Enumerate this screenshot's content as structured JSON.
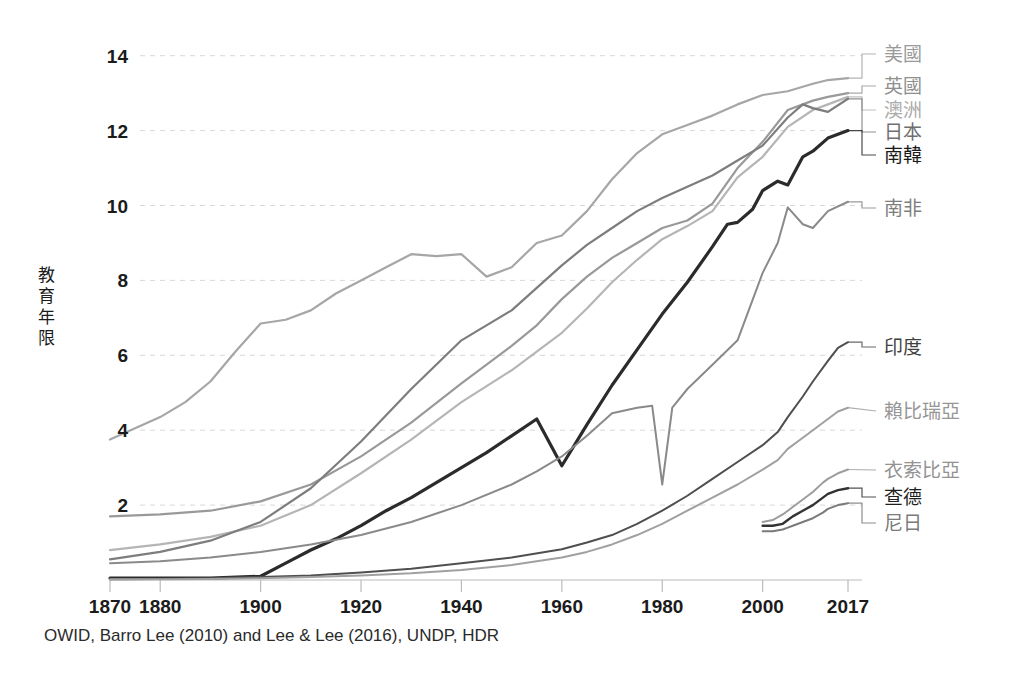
{
  "chart_data": {
    "type": "line",
    "title": "",
    "xlabel": "",
    "ylabel": "教育年限",
    "xlim": [
      1870,
      2017
    ],
    "ylim": [
      0,
      14.6
    ],
    "grid": true,
    "legend_position": "right-inline-labels",
    "source_note": "OWID, Barro Lee (2010) and Lee & Lee (2016), UNDP, HDR",
    "xticks": [
      1870,
      1880,
      1900,
      1920,
      1940,
      1960,
      1980,
      2000,
      2017
    ],
    "xtick_labels": [
      "1870",
      "1880",
      "1900",
      "1920",
      "1940",
      "1960",
      "1980",
      "2000",
      "2017"
    ],
    "yticks": [
      2,
      4,
      6,
      8,
      10,
      12,
      14
    ],
    "ytick_labels": [
      "2",
      "4",
      "6",
      "8",
      "10",
      "12",
      "14"
    ],
    "series": [
      {
        "name": "美國",
        "color": "#a6a6a6",
        "width": 2.2,
        "label_color": "#9a9a9a",
        "label_y": 54,
        "end_value": 13.4,
        "x": [
          1870,
          1875,
          1880,
          1885,
          1890,
          1895,
          1900,
          1905,
          1910,
          1915,
          1920,
          1925,
          1930,
          1935,
          1940,
          1945,
          1950,
          1955,
          1960,
          1965,
          1970,
          1975,
          1980,
          1985,
          1990,
          1995,
          2000,
          2005,
          2010,
          2013,
          2017
        ],
        "values": [
          3.75,
          4.05,
          4.35,
          4.75,
          5.3,
          6.1,
          6.85,
          6.95,
          7.2,
          7.65,
          8.0,
          8.35,
          8.7,
          8.65,
          8.7,
          8.1,
          8.35,
          9.0,
          9.2,
          9.85,
          10.7,
          11.4,
          11.9,
          12.15,
          12.4,
          12.7,
          12.95,
          13.05,
          13.25,
          13.35,
          13.4
        ]
      },
      {
        "name": "英國",
        "color": "#999999",
        "width": 2.2,
        "label_color": "#8f8f8f",
        "label_y": 86,
        "end_value": 13.0,
        "x": [
          1870,
          1880,
          1890,
          1900,
          1910,
          1920,
          1930,
          1940,
          1950,
          1955,
          1960,
          1965,
          1970,
          1975,
          1980,
          1985,
          1990,
          1995,
          2000,
          2005,
          2010,
          2013,
          2017
        ],
        "values": [
          1.7,
          1.75,
          1.85,
          2.1,
          2.55,
          3.3,
          4.2,
          5.25,
          6.25,
          6.8,
          7.5,
          8.1,
          8.6,
          9.0,
          9.4,
          9.6,
          10.05,
          11.0,
          11.7,
          12.55,
          12.8,
          12.9,
          13.0
        ]
      },
      {
        "name": "澳洲",
        "color": "#b5b5b5",
        "width": 2.2,
        "label_color": "#ababab",
        "label_y": 110,
        "end_value": 12.9,
        "x": [
          1870,
          1880,
          1890,
          1900,
          1910,
          1920,
          1930,
          1940,
          1950,
          1955,
          1960,
          1965,
          1970,
          1975,
          1980,
          1985,
          1990,
          1995,
          2000,
          2005,
          2010,
          2013,
          2017
        ],
        "values": [
          0.8,
          0.95,
          1.15,
          1.45,
          2.0,
          2.85,
          3.75,
          4.75,
          5.6,
          6.1,
          6.6,
          7.25,
          7.95,
          8.55,
          9.1,
          9.45,
          9.85,
          10.75,
          11.3,
          12.1,
          12.55,
          12.7,
          12.9
        ]
      },
      {
        "name": "日本",
        "color": "#7d7d7d",
        "width": 2.2,
        "label_color": "#6f6f6f",
        "label_y": 132,
        "end_value": 12.85,
        "x": [
          1870,
          1880,
          1890,
          1900,
          1910,
          1920,
          1930,
          1940,
          1950,
          1955,
          1960,
          1965,
          1970,
          1975,
          1980,
          1985,
          1990,
          1995,
          2000,
          2005,
          2008,
          2010,
          2013,
          2017
        ],
        "values": [
          0.55,
          0.75,
          1.05,
          1.55,
          2.45,
          3.7,
          5.1,
          6.4,
          7.2,
          7.8,
          8.4,
          8.95,
          9.4,
          9.85,
          10.2,
          10.5,
          10.8,
          11.2,
          11.6,
          12.35,
          12.7,
          12.6,
          12.5,
          12.85
        ]
      },
      {
        "name": "南韓",
        "color": "#2b2b2b",
        "width": 3.2,
        "label_color": "#1b1b1b",
        "label_y": 155,
        "end_value": 12.0,
        "x": [
          1870,
          1880,
          1890,
          1900,
          1905,
          1910,
          1915,
          1920,
          1925,
          1930,
          1935,
          1940,
          1945,
          1950,
          1955,
          1960,
          1965,
          1970,
          1975,
          1980,
          1985,
          1990,
          1993,
          1995,
          1998,
          2000,
          2003,
          2005,
          2008,
          2010,
          2013,
          2017
        ],
        "values": [
          0.05,
          0.05,
          0.05,
          0.1,
          0.45,
          0.8,
          1.1,
          1.45,
          1.85,
          2.2,
          2.6,
          3.0,
          3.4,
          3.85,
          4.3,
          3.05,
          4.15,
          5.2,
          6.15,
          7.1,
          7.95,
          8.9,
          9.5,
          9.55,
          9.9,
          10.4,
          10.65,
          10.55,
          11.3,
          11.45,
          11.8,
          12.0
        ]
      },
      {
        "name": "南非",
        "color": "#8a8a8a",
        "width": 2.0,
        "label_color": "#7e7e7e",
        "label_y": 208,
        "end_value": 10.1,
        "x": [
          1870,
          1880,
          1890,
          1900,
          1910,
          1920,
          1930,
          1940,
          1950,
          1955,
          1960,
          1965,
          1970,
          1975,
          1978,
          1980,
          1982,
          1985,
          1990,
          1995,
          2000,
          2003,
          2005,
          2008,
          2010,
          2013,
          2017
        ],
        "values": [
          0.45,
          0.5,
          0.6,
          0.75,
          0.95,
          1.2,
          1.55,
          2.0,
          2.55,
          2.9,
          3.3,
          3.85,
          4.45,
          4.6,
          4.65,
          2.55,
          4.6,
          5.1,
          5.75,
          6.4,
          8.2,
          9.0,
          9.95,
          9.5,
          9.4,
          9.85,
          10.1
        ]
      },
      {
        "name": "印度",
        "color": "#4f4f4f",
        "width": 2.0,
        "label_color": "#3f3f3f",
        "label_y": 347,
        "end_value": 6.35,
        "x": [
          1870,
          1880,
          1890,
          1900,
          1910,
          1920,
          1930,
          1940,
          1950,
          1960,
          1965,
          1970,
          1975,
          1980,
          1985,
          1990,
          1995,
          2000,
          2003,
          2005,
          2008,
          2010,
          2013,
          2015,
          2017
        ],
        "values": [
          0.02,
          0.03,
          0.05,
          0.08,
          0.12,
          0.2,
          0.3,
          0.45,
          0.6,
          0.82,
          1.0,
          1.2,
          1.5,
          1.85,
          2.25,
          2.7,
          3.15,
          3.6,
          3.95,
          4.35,
          4.9,
          5.3,
          5.85,
          6.2,
          6.35
        ]
      },
      {
        "name": "賴比瑞亞",
        "color": "#a0a0a0",
        "width": 2.0,
        "label_color": "#969696",
        "label_y": 411,
        "end_value": 4.6,
        "x": [
          1870,
          1880,
          1890,
          1900,
          1910,
          1920,
          1930,
          1940,
          1950,
          1960,
          1965,
          1970,
          1975,
          1980,
          1985,
          1990,
          1995,
          2000,
          2003,
          2005,
          2008,
          2010,
          2013,
          2015,
          2017
        ],
        "values": [
          0.02,
          0.02,
          0.03,
          0.05,
          0.08,
          0.12,
          0.18,
          0.27,
          0.4,
          0.6,
          0.75,
          0.95,
          1.2,
          1.5,
          1.85,
          2.2,
          2.55,
          2.95,
          3.2,
          3.5,
          3.8,
          4.0,
          4.3,
          4.5,
          4.6
        ]
      },
      {
        "name": "衣索比亞",
        "color": "#9d9d9d",
        "width": 2.0,
        "label_color": "#939393",
        "label_y": 470,
        "end_value": 2.95,
        "x": [
          2000,
          2002,
          2004,
          2005,
          2006,
          2008,
          2010,
          2012,
          2013,
          2015,
          2017
        ],
        "values": [
          1.55,
          1.6,
          1.75,
          1.85,
          1.95,
          2.15,
          2.35,
          2.6,
          2.7,
          2.85,
          2.95
        ]
      },
      {
        "name": "查德",
        "color": "#333333",
        "width": 2.4,
        "label_color": "#1f1f1f",
        "label_y": 497,
        "end_value": 2.45,
        "x": [
          2000,
          2002,
          2004,
          2005,
          2006,
          2008,
          2010,
          2012,
          2013,
          2015,
          2017
        ],
        "values": [
          1.45,
          1.45,
          1.5,
          1.6,
          1.7,
          1.85,
          2.0,
          2.2,
          2.3,
          2.4,
          2.45
        ]
      },
      {
        "name": "尼日",
        "color": "#7a7a7a",
        "width": 2.0,
        "label_color": "#7a7a7a",
        "label_y": 523,
        "end_value": 2.05,
        "x": [
          2000,
          2002,
          2004,
          2005,
          2006,
          2008,
          2010,
          2012,
          2013,
          2015,
          2017
        ],
        "values": [
          1.3,
          1.3,
          1.35,
          1.4,
          1.45,
          1.55,
          1.65,
          1.8,
          1.9,
          2.0,
          2.05
        ]
      }
    ]
  },
  "axes": {
    "y_axis_title": "教育年限",
    "grid_color": "#d8d8d8",
    "axis_color": "#bbbbbb",
    "tick_color": "#1b1b1b"
  },
  "footer": {
    "source": "OWID, Barro Lee (2010) and Lee & Lee (2016), UNDP, HDR"
  }
}
